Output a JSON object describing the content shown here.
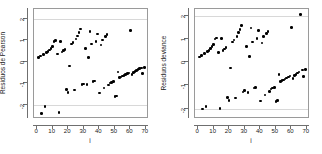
{
  "figure": {
    "title": "",
    "background": "#ffffff",
    "point_color": "#000000",
    "axis_color": "#6f6f6f",
    "grid_color": "#d8d8d8"
  },
  "chart_data": [
    {
      "type": "scatter",
      "panel": "left",
      "title": "",
      "xlabel": "i",
      "ylabel": "Residuos de Pearson",
      "xlim": [
        -2,
        72
      ],
      "ylim": [
        -2.65,
        2.45
      ],
      "xticks": [
        0,
        10,
        20,
        30,
        40,
        50,
        60,
        70
      ],
      "yticks": [
        2,
        1,
        0,
        -1,
        -2
      ],
      "grid": true,
      "gridlines_y": [
        2,
        -2
      ],
      "legend": "none",
      "x": [
        1,
        2,
        3,
        4,
        5,
        6,
        7,
        8,
        9,
        10,
        11,
        12,
        13,
        14,
        15,
        16,
        17,
        18,
        19,
        20,
        21,
        22,
        23,
        24,
        25,
        26,
        27,
        28,
        29,
        30,
        31,
        32,
        33,
        34,
        35,
        36,
        37,
        38,
        39,
        40,
        41,
        42,
        43,
        44,
        45,
        46,
        47,
        48,
        49,
        50,
        51,
        52,
        53,
        54,
        55,
        56,
        57,
        58,
        59,
        60,
        61,
        62,
        63,
        64,
        65,
        66,
        67,
        68,
        69
      ],
      "y": [
        0.2,
        0.28,
        -2.4,
        0.34,
        -2.08,
        0.42,
        0.48,
        0.55,
        0.62,
        0.7,
        0.95,
        0.98,
        0.36,
        -2.35,
        0.95,
        0.45,
        0.52,
        0.58,
        -1.28,
        -1.42,
        -0.2,
        0.82,
        0.9,
        -1.3,
        1.05,
        1.2,
        1.35,
        1.52,
        -1.05,
        -1.02,
        0.62,
        -1.05,
        0.2,
        1.4,
        0.82,
        -0.92,
        -0.88,
        0.95,
        1.3,
        -1.45,
        0.78,
        1.02,
        -1.22,
        1.18,
        1.28,
        -1.08,
        -0.98,
        -0.95,
        -0.92,
        -1.62,
        -1.58,
        -0.48,
        -0.72,
        -0.7,
        -0.66,
        -0.62,
        -0.58,
        -0.55,
        -0.52,
        1.45,
        -0.6,
        -0.5,
        -0.44,
        -0.4,
        -0.36,
        -0.32,
        -0.28,
        -0.55,
        -0.25
      ]
    },
    {
      "type": "scatter",
      "panel": "right",
      "title": "",
      "xlabel": "i",
      "ylabel": "Residuos deviance",
      "xlim": [
        -2,
        72
      ],
      "ylim": [
        -2.45,
        2.3
      ],
      "xticks": [
        0,
        10,
        20,
        30,
        40,
        50,
        60,
        70
      ],
      "yticks": [
        2,
        1,
        0,
        -1,
        -2
      ],
      "grid": true,
      "gridlines_y": [
        2,
        -2
      ],
      "legend": "none",
      "x": [
        1,
        2,
        3,
        4,
        5,
        6,
        7,
        8,
        9,
        10,
        11,
        12,
        13,
        14,
        15,
        16,
        17,
        18,
        19,
        20,
        21,
        22,
        23,
        24,
        25,
        26,
        27,
        28,
        29,
        30,
        31,
        32,
        33,
        34,
        35,
        36,
        37,
        38,
        39,
        40,
        41,
        42,
        43,
        44,
        45,
        46,
        47,
        48,
        49,
        50,
        51,
        52,
        53,
        54,
        55,
        56,
        57,
        58,
        59,
        60,
        61,
        62,
        63,
        64,
        65,
        66,
        67,
        68,
        69
      ],
      "y": [
        0.22,
        0.3,
        -2.02,
        0.38,
        -1.92,
        0.46,
        0.52,
        0.6,
        0.68,
        0.76,
        1.0,
        1.04,
        0.42,
        -2.0,
        1.02,
        0.5,
        0.58,
        0.64,
        -1.52,
        -1.65,
        -0.25,
        0.88,
        0.96,
        -1.55,
        1.12,
        1.28,
        1.42,
        1.58,
        -1.28,
        -1.22,
        0.68,
        -1.3,
        0.24,
        1.48,
        0.88,
        -1.12,
        -1.08,
        1.02,
        1.38,
        -1.68,
        0.84,
        1.1,
        -1.42,
        1.24,
        1.34,
        -1.26,
        -1.16,
        -1.12,
        -1.08,
        -1.7,
        -1.66,
        -0.54,
        -0.82,
        -0.8,
        -0.76,
        -0.72,
        -0.68,
        -0.64,
        -0.6,
        1.5,
        -0.7,
        -0.58,
        -0.52,
        -0.46,
        -0.42,
        2.06,
        -0.34,
        -0.62,
        -0.3
      ]
    }
  ]
}
